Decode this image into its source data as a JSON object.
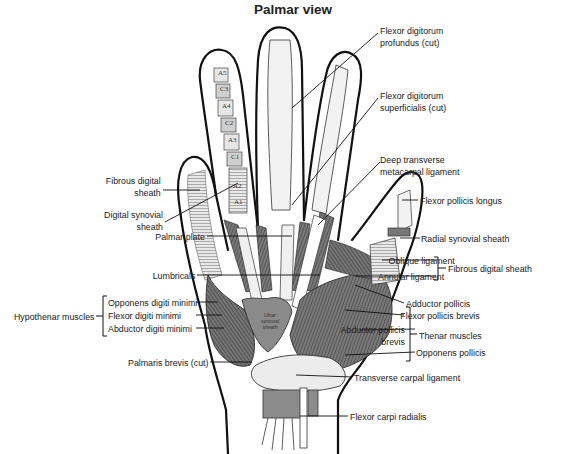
{
  "title": "Palmar view",
  "labels": {
    "fdp": [
      "Flexor digitorum",
      "profundus (cut)"
    ],
    "fds": [
      "Flexor digitorum",
      "superficialis (cut)"
    ],
    "deep_transverse": [
      "Deep transverse",
      "metacarpal ligament"
    ],
    "fibrous_digital_sheath_left": [
      "Fibrous digital",
      "sheath"
    ],
    "digital_synovial_sheath": [
      "Digital synovial",
      "sheath"
    ],
    "flexor_pollicis_longus": "Flexor pollicis longus",
    "palmar_plate": "Palmar plate",
    "radial_synovial_sheath": "Radial synovial sheath",
    "oblique_ligament": "Oblique ligament",
    "annular_ligament": "Annular ligament",
    "fibrous_digital_sheath_group": "Fibrous digital sheath",
    "lumbricals": "Lumbricals",
    "adductor_pollicis": "Adductor pollicis",
    "hypothenar_group": "Hypothenar muscles",
    "opponens_digiti_minimi": "Opponens digiti minimi",
    "flexor_digiti_minimi": "Flexor digiti minimi",
    "abductor_digiti_minimi": "Abductor digiti minimi",
    "flexor_pollicis_brevis": "Flexor pollicis brevis",
    "abductor_pollicis_brevis": [
      "Abductor pollicis",
      "brevis"
    ],
    "thenar_group": "Thenar muscles",
    "opponens_pollicis": "Opponens pollicis",
    "palmaris_brevis": "Palmaris brevis (cut)",
    "transverse_carpal_ligament": "Transverse carpal ligament",
    "flexor_carpi_radialis": "Flexor carpi radialis",
    "ulnar_synovial_sheath": [
      "Ulnar",
      "synovial",
      "sheath"
    ]
  },
  "pulleys": [
    "A5",
    "C3",
    "A4",
    "C2",
    "A3",
    "C1",
    "A2",
    "A1"
  ],
  "colors": {
    "muscle": "#6b6b6b",
    "muscle_dark": "#3f3f3f",
    "sheath": "#9a9a9a",
    "outline": "#111111",
    "label_text": "#222222"
  }
}
